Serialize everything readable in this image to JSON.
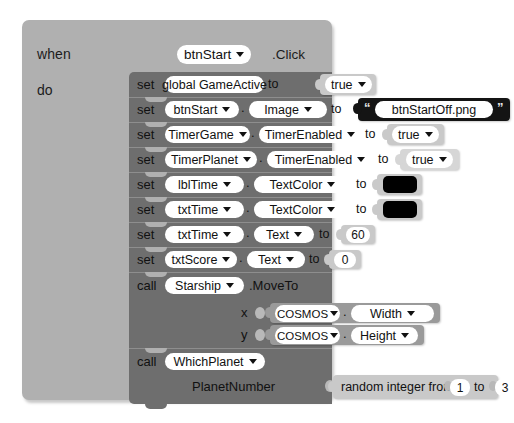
{
  "editor": {
    "name": "mit-app-inventor-blocks-editor",
    "background_color": "#ffffff",
    "event_block_color": "#b0b0b0",
    "statement_block_color": "#6e6e6e",
    "value_block_color": "#c9c9c9",
    "getter_block_color": "#9a9a9a",
    "text_block_color": "#141414",
    "color_block_value": "#000000"
  },
  "event": {
    "keyword_when": "when",
    "keyword_do": "do",
    "component": "btnStart",
    "event_name": ".Click"
  },
  "statements": [
    {
      "keyword": "set",
      "target": "global GameActive",
      "has_dot": false,
      "property": null,
      "to": "to",
      "value_kind": "logic",
      "value": "true"
    },
    {
      "keyword": "set",
      "target": "btnStart",
      "has_dot": true,
      "property": "Image",
      "to": "to",
      "value_kind": "text",
      "value": "btnStartOff.png"
    },
    {
      "keyword": "set",
      "target": "TimerGame",
      "has_dot": true,
      "property": "TimerEnabled",
      "to": "to",
      "value_kind": "logic",
      "value": "true"
    },
    {
      "keyword": "set",
      "target": "TimerPlanet",
      "has_dot": true,
      "property": "TimerEnabled",
      "to": "to",
      "value_kind": "logic",
      "value": "true"
    },
    {
      "keyword": "set",
      "target": "lblTime",
      "has_dot": true,
      "property": "TextColor",
      "to": "to",
      "value_kind": "color",
      "value": "#000000"
    },
    {
      "keyword": "set",
      "target": "txtTime",
      "has_dot": true,
      "property": "TextColor",
      "to": "to",
      "value_kind": "color",
      "value": "#000000"
    },
    {
      "keyword": "set",
      "target": "txtTime",
      "has_dot": true,
      "property": "Text",
      "to": "to",
      "value_kind": "number",
      "value": "60"
    },
    {
      "keyword": "set",
      "target": "txtScore",
      "has_dot": true,
      "property": "Text",
      "to": "to",
      "value_kind": "number",
      "value": "0"
    }
  ],
  "call_moveto": {
    "keyword": "call",
    "component": "Starship",
    "method": ".MoveTo",
    "args": [
      {
        "label": "x",
        "component": "COSMOS",
        "property": "Width"
      },
      {
        "label": "y",
        "component": "COSMOS",
        "property": "Height"
      }
    ]
  },
  "call_whichplanet": {
    "keyword": "call",
    "procedure": "WhichPlanet",
    "arg_label": "PlanetNumber",
    "value_prefix": "random integer from",
    "value_from": "1",
    "value_mid": "to",
    "value_to": "3"
  }
}
